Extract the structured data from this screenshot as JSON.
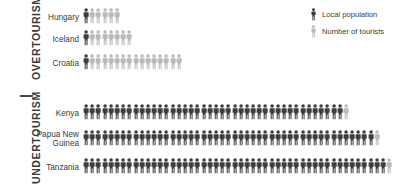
{
  "sections": [
    {
      "id": "overtourism",
      "title": "OVERTOURISM"
    },
    {
      "id": "undertourism",
      "title": "UNDERTOURISM"
    }
  ],
  "legend": {
    "items": [
      {
        "label": "Local population",
        "color": "#3d3d3d",
        "icon": "person-icon"
      },
      {
        "label": "Number of tourists",
        "color": "#b9b9b9",
        "icon": "person-icon"
      }
    ]
  },
  "colors": {
    "local": "#3d3d3d",
    "tourist": "#b9b9b9",
    "text": "#3a3a3a",
    "background": "#ffffff"
  },
  "chart_data": {
    "type": "pictogram",
    "title": "",
    "xlabel": "",
    "ylabel": "",
    "unit_note": "each figure = 1 unit of ratio (locals : tourists)",
    "series": [
      {
        "name": "Local population",
        "color": "#3d3d3d"
      },
      {
        "name": "Number of tourists",
        "color": "#b9b9b9"
      }
    ],
    "groups": [
      {
        "section": "OVERTOURISM",
        "rows": [
          {
            "label": "Hungary",
            "locals": 1,
            "tourists": 5,
            "total": 6
          },
          {
            "label": "Iceland",
            "locals": 1,
            "tourists": 7,
            "total": 8
          },
          {
            "label": "Croatia",
            "locals": 1,
            "tourists": 15,
            "total": 16
          }
        ]
      },
      {
        "section": "UNDERTOURISM",
        "rows": [
          {
            "label": "Kenya",
            "locals": 42,
            "tourists": 1,
            "total": 43
          },
          {
            "label": "Papua New\nGuinea",
            "locals": 47,
            "tourists": 1,
            "total": 48
          },
          {
            "label": "Tanzania",
            "locals": 49,
            "tourists": 1,
            "total": 50
          }
        ]
      }
    ]
  }
}
